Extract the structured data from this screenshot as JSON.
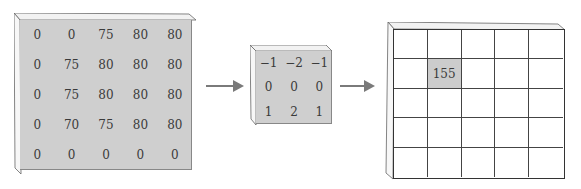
{
  "diagram": {
    "title": "",
    "input_matrix": {
      "rows": [
        [
          "0",
          "0",
          "75",
          "80",
          "80"
        ],
        [
          "0",
          "75",
          "80",
          "80",
          "80"
        ],
        [
          "0",
          "75",
          "80",
          "80",
          "80"
        ],
        [
          "0",
          "70",
          "75",
          "80",
          "80"
        ],
        [
          "0",
          "0",
          "0",
          "0",
          "0"
        ]
      ],
      "fill_color": "#cfcfcf"
    },
    "kernel": {
      "rows": [
        [
          "−1",
          "−2",
          "−1"
        ],
        [
          "0",
          "0",
          "0"
        ],
        [
          "1",
          "2",
          "1"
        ]
      ],
      "fill_color": "#cfcfcf"
    },
    "output_matrix": {
      "rows": [
        [
          "",
          "",
          "",
          "",
          ""
        ],
        [
          "",
          "155",
          "",
          "",
          ""
        ],
        [
          "",
          "",
          "",
          "",
          ""
        ],
        [
          "",
          "",
          "",
          "",
          ""
        ],
        [
          "",
          "",
          "",
          "",
          ""
        ]
      ],
      "highlight": {
        "row": 1,
        "col": 1,
        "value": "155",
        "color": "#cccccc"
      },
      "fill_color": "#ffffff"
    },
    "arrows": [
      {
        "from": "input_matrix",
        "to": "kernel"
      },
      {
        "from": "kernel",
        "to": "output_matrix"
      }
    ]
  }
}
